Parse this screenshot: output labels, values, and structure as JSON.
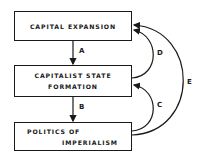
{
  "diagram": {
    "nodes": [
      {
        "id": "capital-expansion",
        "lines": [
          "CAPITAL EXPANSION"
        ]
      },
      {
        "id": "capitalist-state-formation",
        "lines": [
          "CAPITALIST STATE",
          "FORMATION"
        ]
      },
      {
        "id": "politics-of-imperialism",
        "lines": [
          "POLITICS OF",
          "IMPERIALISM"
        ]
      }
    ],
    "edges": [
      {
        "label": "A",
        "from": "capital-expansion",
        "to": "capitalist-state-formation"
      },
      {
        "label": "B",
        "from": "capitalist-state-formation",
        "to": "politics-of-imperialism"
      },
      {
        "label": "C",
        "from": "politics-of-imperialism",
        "to": "capitalist-state-formation"
      },
      {
        "label": "D",
        "from": "capitalist-state-formation",
        "to": "capital-expansion"
      },
      {
        "label": "E",
        "from": "politics-of-imperialism",
        "to": "capital-expansion"
      }
    ],
    "colors": {
      "line": "#1a1a1a",
      "background": "#ffffff"
    }
  }
}
